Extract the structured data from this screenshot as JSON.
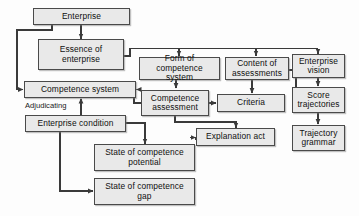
{
  "diagram": {
    "background_color": "#fdfdfd",
    "node_fill_color": "#e9e9e9",
    "node_border_color": "#4a4a4a",
    "edge_color": "#3a3a3a",
    "nodes": [
      {
        "id": "enterprise",
        "label": "Enterprise"
      },
      {
        "id": "essence",
        "label": "Essence of\nenterprise"
      },
      {
        "id": "competence_system",
        "label": "Competence system"
      },
      {
        "id": "enterprise_condition",
        "label": "Enterprise condition"
      },
      {
        "id": "form",
        "label": "Form of\ncompetence system"
      },
      {
        "id": "content",
        "label": "Content of\nassessments"
      },
      {
        "id": "competence_assessment",
        "label": "Competence\nassessment"
      },
      {
        "id": "criteria",
        "label": "Criteria"
      },
      {
        "id": "explanation_act",
        "label": "Explanation act"
      },
      {
        "id": "enterprise_vision",
        "label": "Enterprise\nvision"
      },
      {
        "id": "score_trajectories",
        "label": "Score\ntrajectories"
      },
      {
        "id": "trajectory_grammar",
        "label": "Trajectory\ngrammar"
      },
      {
        "id": "state_potential",
        "label": "State of competence\npotential"
      },
      {
        "id": "state_gap",
        "label": "State of competence\ngap"
      }
    ],
    "edge_labels": [
      {
        "id": "adjudicating",
        "label": "Adjudicating"
      }
    ]
  }
}
